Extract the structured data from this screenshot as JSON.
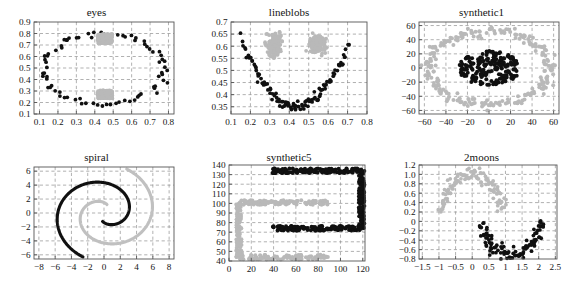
{
  "figure": {
    "title": "",
    "panel_count": 6,
    "background": "#ffffff",
    "colors": {
      "cluster_dark": "#101010",
      "cluster_gray": "#b9b9b9",
      "grid": "#8f8f8f",
      "frame": "#555555",
      "text": "#141414"
    }
  },
  "panels": [
    {
      "id": "eyes",
      "title": "eyes"
    },
    {
      "id": "lineblobs",
      "title": "lineblobs"
    },
    {
      "id": "synthetic1",
      "title": "synthetic1"
    },
    {
      "id": "spiral",
      "title": "spiral"
    },
    {
      "id": "synthetic5",
      "title": "synthetic5"
    },
    {
      "id": "2moons",
      "title": "2moons"
    }
  ],
  "chart_data": [
    {
      "id": "eyes",
      "type": "scatter",
      "title": "eyes",
      "xlabel": "",
      "ylabel": "",
      "xlim": [
        0.07,
        0.83
      ],
      "ylim": [
        0.1,
        0.9
      ],
      "xticks": [
        0.1,
        0.2,
        0.3,
        0.4,
        0.5,
        0.6,
        0.7,
        0.8
      ],
      "xtick_labels": [
        "0.1",
        "0.2",
        "0.3",
        "0.4",
        "0.5",
        "0.6",
        "0.7",
        "0.8"
      ],
      "yticks": [
        0.1,
        0.2,
        0.3,
        0.4,
        0.5,
        0.6,
        0.7,
        0.8,
        0.9
      ],
      "ytick_labels": [
        "0.1",
        "0.2",
        "0.3",
        "0.4",
        "0.5",
        "0.6",
        "0.7",
        "0.8",
        "0.9"
      ],
      "grid": true,
      "legend": "none",
      "marker_size": 1.9,
      "series": [
        {
          "name": "ring",
          "color": "#101010",
          "shape": "ring",
          "n": 78,
          "cx": 0.45,
          "cy": 0.49,
          "rx": 0.325,
          "ry": 0.305,
          "jitter": 0.018,
          "seed": 11
        },
        {
          "name": "eye-upper",
          "color": "#b9b9b9",
          "shape": "blob-rect",
          "n": 230,
          "x0": 0.415,
          "x1": 0.495,
          "y0": 0.715,
          "y1": 0.795,
          "seed": 23
        },
        {
          "name": "eye-lower",
          "color": "#b9b9b9",
          "shape": "blob-rect",
          "n": 230,
          "x0": 0.415,
          "x1": 0.495,
          "y0": 0.235,
          "y1": 0.305,
          "seed": 31
        }
      ]
    },
    {
      "id": "lineblobs",
      "type": "scatter",
      "title": "lineblobs",
      "xlabel": "",
      "ylabel": "",
      "xlim": [
        0.1,
        0.8
      ],
      "ylim": [
        0.32,
        0.7
      ],
      "xticks": [
        0.1,
        0.2,
        0.3,
        0.4,
        0.5,
        0.6,
        0.7,
        0.8
      ],
      "xtick_labels": [
        "0.1",
        "0.2",
        "0.3",
        "0.4",
        "0.5",
        "0.6",
        "0.7",
        "0.8"
      ],
      "yticks": [
        0.35,
        0.4,
        0.45,
        0.5,
        0.55,
        0.6,
        0.65,
        0.7
      ],
      "ytick_labels": [
        "0.35",
        "0.4",
        "0.45",
        "0.5",
        "0.55",
        "0.6",
        "0.65",
        "0.7"
      ],
      "grid": true,
      "legend": "none",
      "marker_size": 1.9,
      "series": [
        {
          "name": "parabola-line",
          "color": "#101010",
          "shape": "parabola",
          "n": 110,
          "x0": 0.155,
          "x1": 0.705,
          "vertex_x": 0.435,
          "vertex_y": 0.352,
          "a": 3.45,
          "jitter": 0.011,
          "seed": 7
        },
        {
          "name": "blob-left",
          "color": "#b9b9b9",
          "shape": "blob-gauss",
          "n": 180,
          "cx": 0.322,
          "cy": 0.605,
          "sx": 0.019,
          "sy": 0.021,
          "seed": 17
        },
        {
          "name": "blob-right",
          "color": "#b9b9b9",
          "shape": "blob-gauss",
          "n": 180,
          "cx": 0.548,
          "cy": 0.608,
          "sx": 0.018,
          "sy": 0.018,
          "seed": 29
        }
      ]
    },
    {
      "id": "synthetic1",
      "type": "scatter",
      "title": "synthetic1",
      "xlabel": "",
      "ylabel": "",
      "xlim": [
        -65,
        65
      ],
      "ylim": [
        -65,
        65
      ],
      "xticks": [
        -60,
        -40,
        -20,
        0,
        20,
        40,
        60
      ],
      "xtick_labels": [
        "−60",
        "−40",
        "−20",
        "0",
        "20",
        "40",
        "60"
      ],
      "yticks": [
        -60,
        -40,
        -20,
        0,
        20,
        40,
        60
      ],
      "ytick_labels": [
        "−60",
        "−40",
        "−20",
        "0",
        "20",
        "40",
        "60"
      ],
      "grid": true,
      "legend": "none",
      "marker_size": 2.0,
      "series": [
        {
          "name": "inner-blob",
          "color": "#101010",
          "shape": "blob-ellipse",
          "n": 210,
          "cx": 0,
          "cy": 0,
          "rx": 29,
          "ry": 24,
          "seed": 5
        },
        {
          "name": "outer-ring",
          "color": "#b9b9b9",
          "shape": "ring",
          "n": 240,
          "cx": 0,
          "cy": 0,
          "rx": 56,
          "ry": 52,
          "jitter": 4.5,
          "seed": 13
        }
      ]
    },
    {
      "id": "spiral",
      "type": "line",
      "title": "spiral",
      "xlabel": "",
      "ylabel": "",
      "xlim": [
        -8.6,
        8.6
      ],
      "ylim": [
        -6.6,
        6.6
      ],
      "xticks": [
        -8,
        -6,
        -4,
        -2,
        0,
        2,
        4,
        6,
        8
      ],
      "xtick_labels": [
        "−8",
        "−6",
        "−4",
        "−2",
        "0",
        "2",
        "4",
        "6",
        "8"
      ],
      "yticks": [
        -6,
        -4,
        -2,
        0,
        2,
        4,
        6
      ],
      "ytick_labels": [
        "−6",
        "−4",
        "−2",
        "0",
        "2",
        "4",
        "6"
      ],
      "grid": true,
      "legend": "none",
      "series": [
        {
          "name": "spiral-dark",
          "color": "#101010",
          "shape": "archimedean",
          "t_start": 1.35,
          "t_end": 7.45,
          "a": 0.0,
          "b": 0.92,
          "phase": 3.141592653589793,
          "cx": 0.1,
          "cy": 0.0
        },
        {
          "name": "spiral-gray",
          "color": "#c0c0c0",
          "shape": "archimedean",
          "t_start": 1.35,
          "t_end": 7.45,
          "a": 0.0,
          "b": 0.92,
          "phase": 0.0,
          "cx": 0.1,
          "cy": 0.0
        }
      ]
    },
    {
      "id": "synthetic5",
      "type": "scatter",
      "title": "synthetic5",
      "xlabel": "",
      "ylabel": "",
      "xlim": [
        0,
        122
      ],
      "ylim": [
        40,
        140
      ],
      "xticks": [
        0,
        20,
        40,
        60,
        80,
        100,
        120
      ],
      "xtick_labels": [
        "0",
        "20",
        "40",
        "60",
        "80",
        "100",
        "120"
      ],
      "yticks": [
        40,
        50,
        60,
        70,
        80,
        90,
        100,
        110,
        120,
        130,
        140
      ],
      "ytick_labels": [
        "40",
        "50",
        "60",
        "70",
        "80",
        "90",
        "100",
        "110",
        "120",
        "130",
        "140"
      ],
      "grid": true,
      "legend": "none",
      "marker_size": 2.0,
      "series": [
        {
          "name": "bracket-dark",
          "color": "#101010",
          "shape": "bracket",
          "n": 420,
          "x0": 39,
          "x1": 119,
          "y_top": 134,
          "y_bot": 74,
          "band": 5.0,
          "vertical_side": "right",
          "seed": 3
        },
        {
          "name": "bracket-gray",
          "color": "#b9b9b9",
          "shape": "bracket",
          "n": 330,
          "x0": 9,
          "x1": 89,
          "y_top": 101,
          "y_bot": 44,
          "band": 5.0,
          "vertical_side": "left",
          "seed": 19
        }
      ]
    },
    {
      "id": "2moons",
      "type": "scatter",
      "title": "2moons",
      "xlabel": "",
      "ylabel": "",
      "xlim": [
        -1.6,
        2.55
      ],
      "ylim": [
        -0.8,
        1.2
      ],
      "xticks": [
        -1.5,
        -1,
        -0.5,
        0,
        0.5,
        1,
        1.5,
        2,
        2.5
      ],
      "xtick_labels": [
        "−1.5",
        "−1",
        "−0.5",
        "0",
        "0.5",
        "1",
        "1.5",
        "2",
        "2.5"
      ],
      "yticks": [
        -0.8,
        -0.6,
        -0.4,
        -0.2,
        0,
        0.2,
        0.4,
        0.6,
        0.8,
        1.0,
        1.2
      ],
      "ytick_labels": [
        "−0.8",
        "−0.6",
        "−0.4",
        "−0.2",
        "0",
        "0.2",
        "0.4",
        "0.6",
        "0.8",
        "1.0",
        "1.2"
      ],
      "grid": true,
      "legend": "none",
      "marker_size": 1.9,
      "series": [
        {
          "name": "moon-upper",
          "color": "#b9b9b9",
          "shape": "moon",
          "n": 110,
          "cx": 0.0,
          "cy": 0.12,
          "r": 0.93,
          "t0": 0.17,
          "t1": 3.02,
          "jitter": 0.075,
          "seed": 41
        },
        {
          "name": "moon-lower",
          "color": "#101010",
          "shape": "moon",
          "n": 110,
          "cx": 1.18,
          "cy": 0.06,
          "r": 0.88,
          "t0": 3.3,
          "t1": 6.22,
          "jitter": 0.075,
          "seed": 47
        }
      ]
    }
  ]
}
